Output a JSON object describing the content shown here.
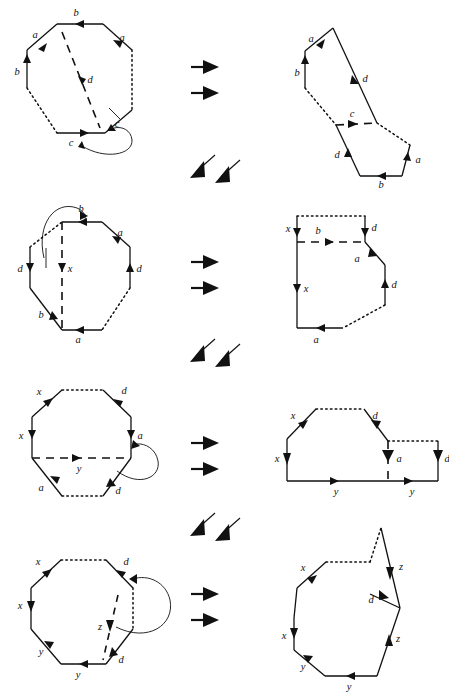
{
  "figure": {
    "type": "diagram",
    "stroke_color": "#111111",
    "background_color": "#ffffff"
  },
  "rows": [
    {
      "id": "row-1",
      "left_polygon": {
        "name": "octagon-step-1",
        "sides": 8,
        "edge_labels": [
          "b",
          "a",
          "b",
          "c",
          "c",
          "a"
        ],
        "diagonal_label": "d",
        "diagonal_style": "dashed",
        "dotted_edges": 2,
        "has_curved_connector": true
      },
      "arrows": {
        "name": "double-right-arrow",
        "count": 2,
        "direction": "right"
      },
      "right_polygon": {
        "name": "polygon-step-1-result",
        "edge_labels": [
          "a",
          "b",
          "d",
          "c",
          "d",
          "b",
          "a"
        ],
        "dashed_label": "c",
        "dotted_edges": 2
      }
    },
    {
      "id": "row-2",
      "connector_arrows": {
        "name": "double-diagonal-arrow",
        "count": 2,
        "direction": "down-left"
      },
      "left_polygon": {
        "name": "octagon-step-2",
        "sides": 8,
        "edge_labels": [
          "b",
          "a",
          "d",
          "d",
          "a",
          "b"
        ],
        "diagonal_label": "x",
        "diagonal_style": "dashed",
        "dotted_edges": 2,
        "has_curved_connector": true
      },
      "arrows": {
        "name": "double-right-arrow",
        "count": 2,
        "direction": "right"
      },
      "right_polygon": {
        "name": "polygon-step-2-result",
        "edge_labels": [
          "x",
          "d",
          "a",
          "d",
          "a",
          "x"
        ],
        "dashed_label": "b",
        "dotted_edges": 2
      }
    },
    {
      "id": "row-3",
      "connector_arrows": {
        "name": "double-diagonal-arrow",
        "count": 2,
        "direction": "down-left"
      },
      "left_polygon": {
        "name": "octagon-step-3",
        "sides": 8,
        "edge_labels": [
          "x",
          "d",
          "x",
          "a",
          "a",
          "d"
        ],
        "diagonal_label": "y",
        "diagonal_style": "dashed",
        "dotted_edges": 2,
        "has_curved_connector": true
      },
      "arrows": {
        "name": "double-right-arrow",
        "count": 2,
        "direction": "right"
      },
      "right_polygon": {
        "name": "polygon-step-3-result",
        "edge_labels": [
          "x",
          "d",
          "x",
          "a",
          "d",
          "y",
          "y"
        ],
        "dotted_edges": 2
      }
    },
    {
      "id": "row-4",
      "connector_arrows": {
        "name": "double-diagonal-arrow",
        "count": 2,
        "direction": "down-left"
      },
      "left_polygon": {
        "name": "octagon-step-4",
        "sides": 8,
        "edge_labels": [
          "x",
          "d",
          "x",
          "d",
          "y",
          "y"
        ],
        "diagonal_label": "z",
        "diagonal_style": "dashed",
        "dotted_edges": 2,
        "has_curved_connector": true
      },
      "arrows": {
        "name": "double-right-arrow",
        "count": 2,
        "direction": "right"
      },
      "right_polygon": {
        "name": "polygon-step-4-result",
        "edge_labels": [
          "x",
          "z",
          "d",
          "x",
          "z",
          "y",
          "y"
        ],
        "dotted_edges": 1
      }
    }
  ],
  "labels": {
    "r1l": {
      "b_top": "b",
      "a_upleft": "a",
      "a_upright": "a",
      "b_left": "b",
      "c_bottom": "c",
      "c_right": "c",
      "d_diag": "d"
    },
    "r1r": {
      "a": "a",
      "b": "b",
      "d_upper": "d",
      "c": "c",
      "d_lower": "d",
      "b_bottom": "b",
      "a_right": "a"
    },
    "r2l": {
      "b_top": "b",
      "a": "a",
      "d_left": "d",
      "d_right": "d",
      "x": "x",
      "b_lower": "b",
      "a_bottom": "a"
    },
    "r2r": {
      "x_top": "x",
      "d_top": "d",
      "b": "b",
      "a": "a",
      "d_right": "d",
      "x_left": "x",
      "a_bottom": "a"
    },
    "r3l": {
      "x_top": "x",
      "d_top": "d",
      "x_left": "x",
      "a_right": "a",
      "y": "y",
      "a_bottom": "a",
      "d_bottom": "d"
    },
    "r3r": {
      "x_top": "x",
      "d_top": "d",
      "x_left": "x",
      "a": "a",
      "d_right": "d",
      "y_left": "y",
      "y_right": "y"
    },
    "r4l": {
      "x_top": "x",
      "d_top": "d",
      "x_left": "x",
      "z": "z",
      "d_right": "d",
      "y_left": "y",
      "y_bottom": "y"
    },
    "r4r": {
      "x_top": "x",
      "z_top": "z",
      "d": "d",
      "x_left": "x",
      "z_right": "z",
      "y_left": "y",
      "y_bottom": "y"
    }
  }
}
